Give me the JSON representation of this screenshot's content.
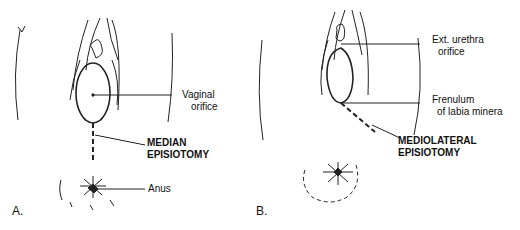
{
  "figure": {
    "panel_a": {
      "letter": "A.",
      "labels": {
        "vaginal_orifice_1": "Vaginal",
        "vaginal_orifice_2": "orifice",
        "incision_1": "MEDIAN",
        "incision_2": "EPISIOTOMY",
        "anus": "Anus"
      }
    },
    "panel_b": {
      "letter": "B.",
      "labels": {
        "urethra_1": "Ext. urethra",
        "urethra_2": "orifice",
        "frenulum_1": "Frenulum",
        "frenulum_2": "of labia minera",
        "incision_1": "MEDIOLATERAL",
        "incision_2": "EPISIOTOMY"
      }
    }
  }
}
